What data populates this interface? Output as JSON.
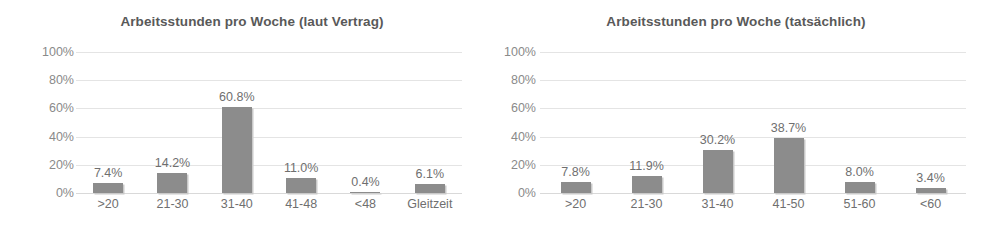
{
  "chart_data": [
    {
      "type": "bar",
      "title": "Arbeitsstunden pro Woche (laut Vertrag)",
      "xlabel": "",
      "ylabel": "",
      "categories": [
        ">20",
        "21-30",
        "31-40",
        "41-48",
        "<48",
        "Gleitzeit"
      ],
      "values": [
        7.4,
        14.2,
        60.8,
        11.0,
        0.4,
        6.1
      ],
      "data_labels": [
        "7.4%",
        "14.2%",
        "60.8%",
        "11.0%",
        "0.4%",
        "6.1%"
      ],
      "ylim": [
        0,
        100
      ],
      "yticks": [
        0,
        20,
        40,
        60,
        80,
        100
      ],
      "ytick_labels": [
        "0%",
        "20%",
        "40%",
        "60%",
        "80%",
        "100%"
      ],
      "grid": true,
      "legend": false,
      "bar_color": "#8c8c8c"
    },
    {
      "type": "bar",
      "title": "Arbeitsstunden pro Woche (tatsächlich)",
      "xlabel": "",
      "ylabel": "",
      "categories": [
        ">20",
        "21-30",
        "31-40",
        "41-50",
        "51-60",
        "<60"
      ],
      "values": [
        7.8,
        11.9,
        30.2,
        38.7,
        8.0,
        3.4
      ],
      "data_labels": [
        "7.8%",
        "11.9%",
        "30.2%",
        "38.7%",
        "8.0%",
        "3.4%"
      ],
      "ylim": [
        0,
        100
      ],
      "yticks": [
        0,
        20,
        40,
        60,
        80,
        100
      ],
      "ytick_labels": [
        "0%",
        "20%",
        "40%",
        "60%",
        "80%",
        "100%"
      ],
      "grid": true,
      "legend": false,
      "bar_color": "#8c8c8c"
    }
  ],
  "colors": {
    "bar": "#8c8c8c",
    "bar_shadow": "#c9c9c9",
    "gridline": "#e4e4e4",
    "title_text": "#595959",
    "axis_text": "#8a8a8a",
    "label_text": "#6f6f6f",
    "background": "#ffffff"
  }
}
